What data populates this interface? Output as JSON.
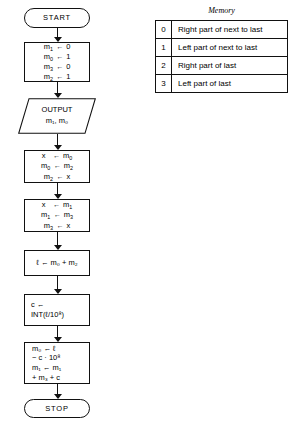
{
  "flowchart": {
    "title": "algorithm-flowchart",
    "nodes": [
      {
        "id": "start",
        "type": "terminator",
        "label": "START"
      },
      {
        "id": "init",
        "type": "process",
        "lines": [
          {
            "lhs": "m",
            "lhs_sub": "1",
            "arrow": "←",
            "rhs": "0"
          },
          {
            "lhs": "m",
            "lhs_sub": "0",
            "arrow": "←",
            "rhs": "1"
          },
          {
            "lhs": "m",
            "lhs_sub": "3",
            "arrow": "←",
            "rhs": "0"
          },
          {
            "lhs": "m",
            "lhs_sub": "2",
            "arrow": "←",
            "rhs": "1"
          }
        ]
      },
      {
        "id": "output",
        "type": "io",
        "label": "OUTPUT",
        "operands": "m₁, m₀"
      },
      {
        "id": "swap_a",
        "type": "process",
        "lines": [
          {
            "lhs": "x",
            "lhs_sub": "",
            "arrow": "←",
            "rhs": "m",
            "rhs_sub": "0"
          },
          {
            "lhs": "m",
            "lhs_sub": "0",
            "arrow": "←",
            "rhs": "m",
            "rhs_sub": "2"
          },
          {
            "lhs": "m",
            "lhs_sub": "2",
            "arrow": "←",
            "rhs": "x"
          }
        ]
      },
      {
        "id": "swap_b",
        "type": "process",
        "lines": [
          {
            "lhs": "x",
            "lhs_sub": "",
            "arrow": "←",
            "rhs": "m",
            "rhs_sub": "1"
          },
          {
            "lhs": "m",
            "lhs_sub": "1",
            "arrow": "←",
            "rhs": "m",
            "rhs_sub": "3"
          },
          {
            "lhs": "m",
            "lhs_sub": "3",
            "arrow": "←",
            "rhs": "x"
          }
        ]
      },
      {
        "id": "sum",
        "type": "process",
        "expr": "ℓ ← m₀ + m₂"
      },
      {
        "id": "carry",
        "type": "process",
        "expr_line1": "c ←",
        "expr_line2": "INT(ℓ/10⁸)"
      },
      {
        "id": "reduce",
        "type": "process",
        "expr_line1": "m₀ ← ℓ",
        "expr_line2": "− c · 10⁸",
        "expr_line3": "m₁ ← m₁",
        "expr_line4": "+ m₃ + c"
      },
      {
        "id": "stop",
        "type": "terminator",
        "label": "STOP"
      }
    ],
    "connector_icon": "down-arrow-icon"
  },
  "memory": {
    "title": "Memory",
    "rows": [
      {
        "index": "0",
        "description": "Right part of next to last"
      },
      {
        "index": "1",
        "description": "Left part of next to last"
      },
      {
        "index": "2",
        "description": "Right part of last"
      },
      {
        "index": "3",
        "description": "Left part of last"
      }
    ]
  },
  "colors": {
    "line": "#111111",
    "background": "#ffffff",
    "text": "#000000"
  }
}
